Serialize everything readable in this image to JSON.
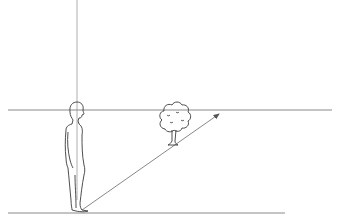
{
  "diagram": {
    "title": "Perspective: eye level, horizon line and viewer sightline",
    "colors": {
      "line": "#8a8a8a",
      "ink": "#3a3a3a",
      "background": "#ffffff"
    },
    "elements": {
      "horizon_line": {
        "x1": 8,
        "y1": 110,
        "x2": 332,
        "y2": 110
      },
      "ground_line": {
        "x1": 8,
        "y1": 213,
        "x2": 285,
        "y2": 213
      },
      "vertical_line": {
        "x1": 77,
        "y1": 0,
        "x2": 77,
        "y2": 212
      },
      "sightline_arrow": {
        "x1": 80,
        "y1": 211,
        "x2": 220,
        "y2": 113
      },
      "person": {
        "head_x": 76,
        "head_y": 112,
        "feet_y": 212
      },
      "tree": {
        "crown_x": 174,
        "crown_y": 116,
        "trunk_base_y": 145
      }
    }
  }
}
